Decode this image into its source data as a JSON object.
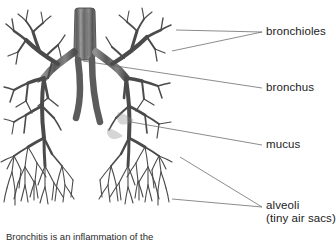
{
  "figure": {
    "alt_title": "Diagram of the human bronchial tree within the lungs",
    "illustration_name": "bronchial-tree-illustration",
    "colors": {
      "background": "#ffffff",
      "airway_dark": "#3a3a3a",
      "airway_mid": "#6e6e6e",
      "airway_light": "#a8a8a8",
      "leader_line": "#5a5a5a",
      "text": "#1b1b1b"
    }
  },
  "labels": [
    {
      "id": "bronchioles",
      "text": "bronchioles",
      "sub": "",
      "leaders": [
        {
          "x1": 176,
          "y1": 30,
          "x2": 262,
          "y2": 32
        },
        {
          "x1": 172,
          "y1": 51,
          "x2": 262,
          "y2": 32
        }
      ]
    },
    {
      "id": "bronchus",
      "text": "bronchus",
      "sub": "",
      "leaders": [
        {
          "x1": 83,
          "y1": 61,
          "x2": 262,
          "y2": 88
        }
      ]
    },
    {
      "id": "mucus",
      "text": "mucus",
      "sub": "",
      "leaders": [
        {
          "x1": 131,
          "y1": 122,
          "x2": 262,
          "y2": 145
        }
      ]
    },
    {
      "id": "alveoli",
      "text": "alveoli",
      "sub": "(tiny air sacs)",
      "leaders": [
        {
          "x1": 180,
          "y1": 157,
          "x2": 262,
          "y2": 207
        },
        {
          "x1": 172,
          "y1": 199,
          "x2": 262,
          "y2": 207
        }
      ]
    }
  ],
  "caption": {
    "line1": "Bronchitis is an inflammation of the"
  }
}
